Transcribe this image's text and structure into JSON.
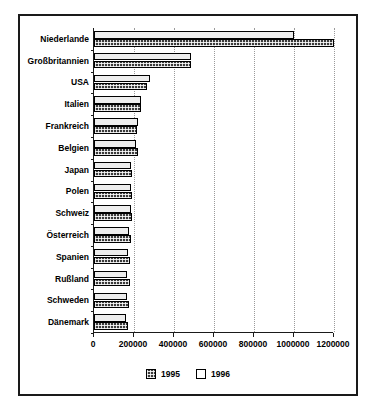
{
  "chart_data": {
    "type": "bar",
    "orientation": "horizontal",
    "title": "",
    "subtitle": "",
    "xlabel": "",
    "ylabel": "",
    "xlim": [
      0,
      1200000
    ],
    "ylim": null,
    "grid": true,
    "grid_axis": "x",
    "legend_position": "bottom-center",
    "xticks": [
      0,
      200000,
      400000,
      600000,
      800000,
      1000000,
      1200000
    ],
    "xtick_labels": [
      "0",
      "200000",
      "400000",
      "600000",
      "800000",
      "1000000",
      "1200000"
    ],
    "categories": [
      "Niederlande",
      "Großbritannien",
      "USA",
      "Italien",
      "Frankreich",
      "Belgien",
      "Japan",
      "Polen",
      "Schweiz",
      "Österreich",
      "Spanien",
      "Rußland",
      "Schweden",
      "Dänemark"
    ],
    "series": [
      {
        "name": "1995",
        "pattern": "crosshatch",
        "color": "#3a3a3a",
        "values": [
          1200000,
          487000,
          267000,
          235000,
          217000,
          222000,
          190000,
          188000,
          188000,
          184000,
          181000,
          178000,
          175000,
          172000
        ]
      },
      {
        "name": "1996",
        "pattern": "solid-light",
        "color": "#ededed",
        "values": [
          1000000,
          485000,
          278000,
          233000,
          218000,
          212000,
          183000,
          184000,
          186000,
          173000,
          172000,
          166000,
          164000,
          160000
        ]
      }
    ],
    "legend_entries": [
      "1995",
      "1996"
    ]
  }
}
